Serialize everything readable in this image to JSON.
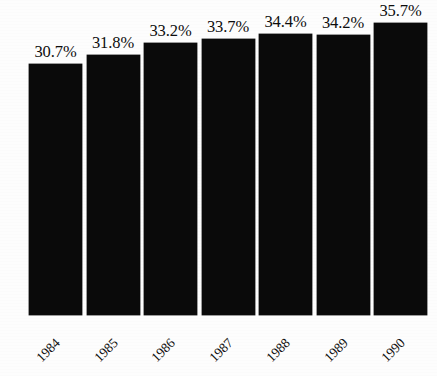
{
  "chart_data": {
    "type": "bar",
    "title": "",
    "subtitle": "",
    "xlabel": "",
    "ylabel": "",
    "categories": [
      "1984",
      "1985",
      "1986",
      "1987",
      "1988",
      "1989",
      "1990"
    ],
    "values": [
      30.7,
      31.8,
      33.2,
      33.7,
      34.4,
      34.2,
      35.7
    ],
    "value_labels": [
      "30.7%",
      "31.8%",
      "33.2%",
      "33.7%",
      "34.4%",
      "34.2%",
      "35.7%"
    ],
    "unit": "%",
    "ylim": [
      0,
      38.5
    ],
    "grid": false,
    "legend": null,
    "legend_position": "none",
    "axis_visible": false,
    "tick_labels_rotation_deg": -45,
    "bar_color": "#0a0a0a",
    "background_color": "#fdfdfd",
    "label_color": "#0d0d0d"
  },
  "layout": {
    "baseline_y": 315,
    "bar_left_start": 29,
    "bar_width": 53,
    "bar_gap": 4.5,
    "value_label_offset": 20
  }
}
